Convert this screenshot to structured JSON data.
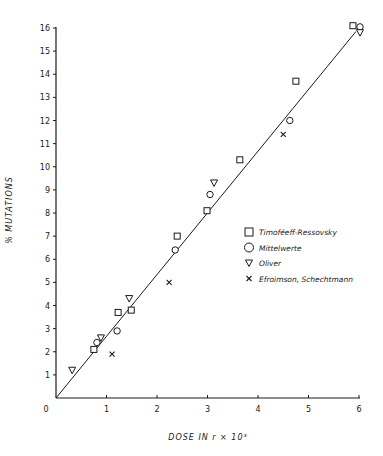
{
  "chart_data": {
    "type": "scatter",
    "title": "",
    "xlabel": "DOSE IN r × 10³",
    "ylabel": "% MUTATIONS",
    "xlim": [
      0,
      6
    ],
    "ylim": [
      0,
      16
    ],
    "x_ticks": [
      "0",
      "1",
      "2",
      "3",
      "4",
      "5",
      "6"
    ],
    "y_ticks": [
      "0",
      "1",
      "2",
      "3",
      "4",
      "5",
      "6",
      "7",
      "8",
      "9",
      "10",
      "11",
      "12",
      "13",
      "14",
      "15",
      "16"
    ],
    "grid": false,
    "legend_position": "right-middle",
    "fit_line": {
      "x": [
        0,
        5.94
      ],
      "y": [
        0,
        15.85
      ],
      "slope": 2.67
    },
    "series": [
      {
        "name": "Timoféeff-Ressovsky",
        "marker": "square",
        "x": [
          0.75,
          1.23,
          1.49,
          2.4,
          2.99,
          3.64,
          4.75,
          5.88
        ],
        "y": [
          2.1,
          3.7,
          3.8,
          7.0,
          8.1,
          10.3,
          13.7,
          16.1
        ]
      },
      {
        "name": "Mittelwerte",
        "marker": "circle",
        "x": [
          0.81,
          1.21,
          2.36,
          3.05,
          4.63,
          6.02
        ],
        "y": [
          2.4,
          2.9,
          6.4,
          8.8,
          12.0,
          16.05
        ]
      },
      {
        "name": "Oliver",
        "marker": "triangle-down",
        "x": [
          0.32,
          0.89,
          1.45,
          3.13,
          6.02
        ],
        "y": [
          1.2,
          2.6,
          4.3,
          9.3,
          15.8
        ]
      },
      {
        "name": "Efroimson, Schechtmann",
        "marker": "x",
        "x": [
          1.11,
          2.24,
          4.5
        ],
        "y": [
          1.9,
          5.0,
          11.4
        ]
      }
    ]
  },
  "legend": {
    "items": [
      {
        "symbol": "square",
        "label": "Timoféeff-Ressovsky"
      },
      {
        "symbol": "circle",
        "label": "Mittelwerte"
      },
      {
        "symbol": "triangle-down",
        "label": "Oliver"
      },
      {
        "symbol": "x",
        "label": "Efroimson, Schechtmann"
      }
    ]
  },
  "colors": {
    "ink": "#1a1a1a",
    "background": "#ffffff"
  }
}
